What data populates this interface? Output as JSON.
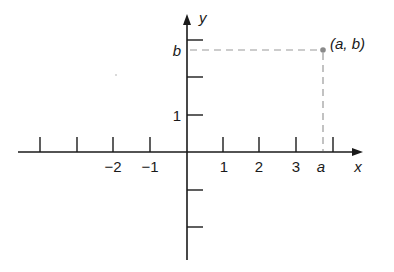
{
  "diagram": {
    "type": "cartesian-plane",
    "x_axis": {
      "label": "x",
      "tick_labels": [
        "−2",
        "−1",
        "1",
        "2",
        "3"
      ],
      "tick_values": [
        -2,
        -1,
        1,
        2,
        3
      ],
      "special_label": "a"
    },
    "y_axis": {
      "label": "y",
      "tick_labels": [
        "1"
      ],
      "special_label": "b"
    },
    "point": {
      "label": "(a, b)",
      "x_symbol": "a",
      "y_symbol": "b"
    },
    "colors": {
      "axis": "#1a1a1a",
      "dashed": "#9a9a9a",
      "point": "#8a8a8a"
    }
  }
}
